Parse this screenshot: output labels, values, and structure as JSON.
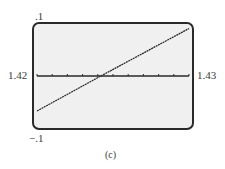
{
  "chart_data": {
    "type": "line",
    "title": "",
    "caption": "(c)",
    "xlabel": "",
    "ylabel": "",
    "xlim": [
      1.42,
      1.43
    ],
    "ylim": [
      -0.1,
      0.1
    ],
    "x_tick_step": 0.001,
    "grid": false,
    "window_labels": {
      "xmin": "1.42",
      "xmax": "1.43",
      "ymin": "−.1",
      "ymax": ".1"
    },
    "series": [
      {
        "name": "f(x)",
        "x": [
          1.42,
          1.4242,
          1.43
        ],
        "y": [
          -0.07,
          0.0,
          0.095
        ]
      }
    ],
    "colors": {
      "screen": "#f0f0f0",
      "frame": "#2a2a2a",
      "line": "#2a2a2a"
    }
  }
}
